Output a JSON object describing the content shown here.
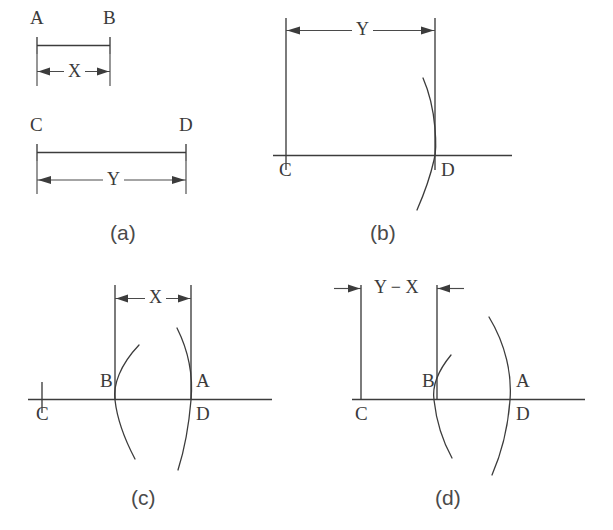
{
  "figure": {
    "background_color": "#ffffff",
    "line_color": "#3c3c3c",
    "text_color": "#3a3a3a"
  },
  "panels": [
    {
      "id": "a",
      "caption": "(a)",
      "description": "Two given horizontal segments with their lengths marked",
      "points": [
        {
          "name": "A",
          "label": "A"
        },
        {
          "name": "B",
          "label": "B"
        },
        {
          "name": "C",
          "label": "C"
        },
        {
          "name": "D",
          "label": "D"
        }
      ],
      "dimensions": [
        {
          "name": "segment-ab-length",
          "label": "X",
          "arrow_style": "outward"
        },
        {
          "name": "segment-cd-length",
          "label": "Y",
          "arrow_style": "outward"
        }
      ]
    },
    {
      "id": "b",
      "caption": "(b)",
      "description": "Segment CD laid on a baseline with compass arc struck at D",
      "points": [
        {
          "name": "C",
          "label": "C"
        },
        {
          "name": "D",
          "label": "D"
        }
      ],
      "dimensions": [
        {
          "name": "segment-cd-length",
          "label": "Y",
          "arrow_style": "outward"
        }
      ],
      "arcs": [
        {
          "name": "arc-at-d",
          "through_point": "D"
        }
      ]
    },
    {
      "id": "c",
      "caption": "(c)",
      "description": "Length X stepped back from D to locate point B on the baseline",
      "points": [
        {
          "name": "C",
          "label": "C"
        },
        {
          "name": "B",
          "label": "B"
        },
        {
          "name": "A",
          "label": "A"
        },
        {
          "name": "D",
          "label": "D"
        }
      ],
      "dimensions": [
        {
          "name": "segment-ba-length",
          "label": "X",
          "arrow_style": "outward"
        }
      ],
      "arcs": [
        {
          "name": "arc-at-b",
          "through_point": "B"
        },
        {
          "name": "arc-at-a",
          "through_point": "A"
        }
      ]
    },
    {
      "id": "d",
      "caption": "(d)",
      "description": "Remaining segment CB equals the difference Y minus X",
      "points": [
        {
          "name": "C",
          "label": "C"
        },
        {
          "name": "B",
          "label": "B"
        },
        {
          "name": "A",
          "label": "A"
        },
        {
          "name": "D",
          "label": "D"
        }
      ],
      "dimensions": [
        {
          "name": "segment-cb-length",
          "label": "Y − X",
          "arrow_style": "inward"
        }
      ],
      "arcs": [
        {
          "name": "arc-at-b",
          "through_point": "B"
        },
        {
          "name": "arc-at-a",
          "through_point": "A"
        }
      ]
    }
  ]
}
